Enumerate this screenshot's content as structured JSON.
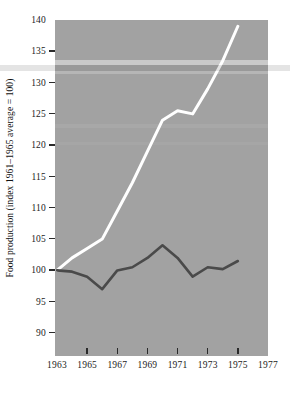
{
  "chart_data": {
    "type": "line",
    "title": "",
    "xlabel": "",
    "ylabel": "Food production (index 1961–1965 average = 100)",
    "xlim": [
      1963,
      1977
    ],
    "ylim": [
      87,
      140
    ],
    "grid": false,
    "legend": "none",
    "xticks": [
      1963,
      1965,
      1967,
      1969,
      1971,
      1973,
      1975,
      1977
    ],
    "yticks": [
      90,
      95,
      100,
      105,
      110,
      115,
      120,
      125,
      130,
      135,
      140
    ],
    "x": [
      1963,
      1964,
      1965,
      1966,
      1967,
      1968,
      1969,
      1970,
      1971,
      1972,
      1973,
      1974,
      1975
    ],
    "series": [
      {
        "name": "total-food-production",
        "color": "#ffffff",
        "values": [
          100.0,
          102.0,
          103.5,
          105.0,
          109.5,
          114.0,
          119.0,
          124.0,
          125.5,
          125.0,
          129.0,
          133.5,
          139.0
        ]
      },
      {
        "name": "per-capita-food-production",
        "color": "#4a4a4a",
        "values": [
          100.0,
          99.8,
          99.0,
          97.0,
          100.0,
          100.5,
          102.0,
          104.0,
          102.0,
          99.0,
          100.5,
          100.2,
          101.5
        ]
      }
    ]
  },
  "axes": {
    "y_title": "Food production (index 1961–1965 average = 100)",
    "y_tick_labels": [
      "140",
      "135",
      "130",
      "125",
      "120",
      "115",
      "110",
      "105",
      "100",
      "95",
      "90"
    ],
    "x_tick_labels": [
      "1963",
      "1965",
      "1967",
      "1969",
      "1971",
      "1973",
      "1975",
      "1977"
    ]
  },
  "colors": {
    "panel_background": "#a2a2a2",
    "page_background": "#ffffff",
    "upper_line": "#ffffff",
    "lower_line": "#4a4a4a",
    "tick": "#2a2a2a",
    "text": "#1a1a1a"
  }
}
